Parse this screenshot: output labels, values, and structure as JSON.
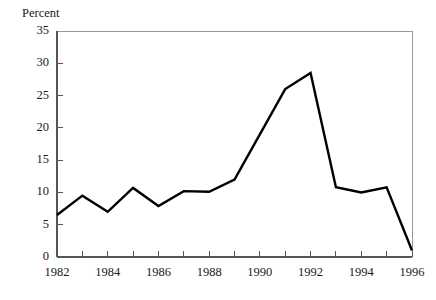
{
  "chart_data": {
    "type": "line",
    "title": "",
    "ylabel": "Percent",
    "xlabel": "",
    "grid": false,
    "legend": "none",
    "xlim": [
      1982,
      1996
    ],
    "ylim": [
      0,
      35
    ],
    "yticks": [
      0,
      5,
      10,
      15,
      20,
      25,
      30,
      35
    ],
    "ytick_labels": [
      "0",
      "5",
      "10",
      "15",
      "20",
      "25",
      "30",
      "35"
    ],
    "xticks": [
      1982,
      1983,
      1984,
      1985,
      1986,
      1987,
      1988,
      1989,
      1990,
      1991,
      1992,
      1993,
      1994,
      1995,
      1996
    ],
    "xtick_labels": [
      "1982",
      "",
      "1984",
      "",
      "1986",
      "",
      "1988",
      "",
      "1990",
      "",
      "1992",
      "",
      "1994",
      "",
      "1996"
    ],
    "xtick_labels_shown": [
      "1982",
      "1984",
      "1986",
      "1988",
      "1990",
      "1992",
      "1994",
      "1996"
    ],
    "x": [
      1982,
      1983,
      1984,
      1985,
      1986,
      1987,
      1988,
      1989,
      1990,
      1991,
      1992,
      1993,
      1994,
      1995,
      1996
    ],
    "values": [
      6.5,
      9.5,
      7.0,
      10.7,
      7.9,
      10.2,
      10.1,
      12.0,
      19.0,
      26.0,
      28.5,
      10.8,
      10.0,
      10.8,
      1.0
    ],
    "series": [
      {
        "name": "Percent",
        "values": [
          6.5,
          9.5,
          7.0,
          10.7,
          7.9,
          10.2,
          10.1,
          12.0,
          19.0,
          26.0,
          28.5,
          10.8,
          10.0,
          10.8,
          1.0
        ]
      }
    ],
    "line_color": "#000000",
    "frame_color": "#999999",
    "axis_color": "#555555"
  }
}
